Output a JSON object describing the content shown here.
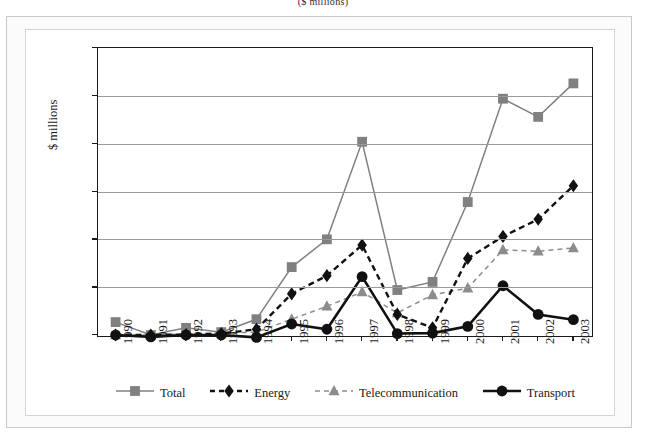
{
  "subtitle": "($ millions)",
  "chart_data": {
    "type": "line",
    "title": "",
    "subtitle": "($ millions)",
    "xlabel": "",
    "ylabel": "$ millions",
    "ylim": [
      0,
      3000
    ],
    "ytick_labels": [
      "3 000",
      "2 500",
      "2 000",
      "1 500",
      "1 000",
      "500",
      "0"
    ],
    "ytick_values": [
      3000,
      2500,
      2000,
      1500,
      1000,
      500,
      0
    ],
    "grid": true,
    "legend_position": "bottom",
    "categories": [
      "1990",
      "1991",
      "1992",
      "1993",
      "1994",
      "1995",
      "1996",
      "1997",
      "1998",
      "1999",
      "2000",
      "2001",
      "2002",
      "2003"
    ],
    "series": [
      {
        "name": "Total",
        "color": "#808080",
        "marker": "square",
        "dash": "solid",
        "values": [
          135,
          0,
          75,
          30,
          165,
          710,
          1000,
          2020,
          470,
          555,
          1390,
          2470,
          2280,
          2630
        ]
      },
      {
        "name": "Energy",
        "color": "#111111",
        "marker": "diamond",
        "dash": "dashed",
        "values": [
          0,
          0,
          5,
          15,
          60,
          430,
          620,
          940,
          215,
          75,
          800,
          1030,
          1210,
          1560
        ]
      },
      {
        "name": "Telecommunication",
        "color": "#8c8c8c",
        "marker": "triangle",
        "dash": "dashed",
        "values": [
          0,
          0,
          10,
          20,
          30,
          165,
          300,
          450,
          230,
          420,
          490,
          890,
          875,
          910
        ]
      },
      {
        "name": "Transport",
        "color": "#111111",
        "marker": "circle",
        "dash": "solid",
        "values": [
          0,
          -20,
          0,
          0,
          -25,
          115,
          60,
          610,
          15,
          20,
          90,
          515,
          215,
          160
        ]
      }
    ]
  },
  "legend": [
    {
      "label": "Total"
    },
    {
      "label": "Energy"
    },
    {
      "label": "Telecommunication"
    },
    {
      "label": "Transport"
    }
  ]
}
